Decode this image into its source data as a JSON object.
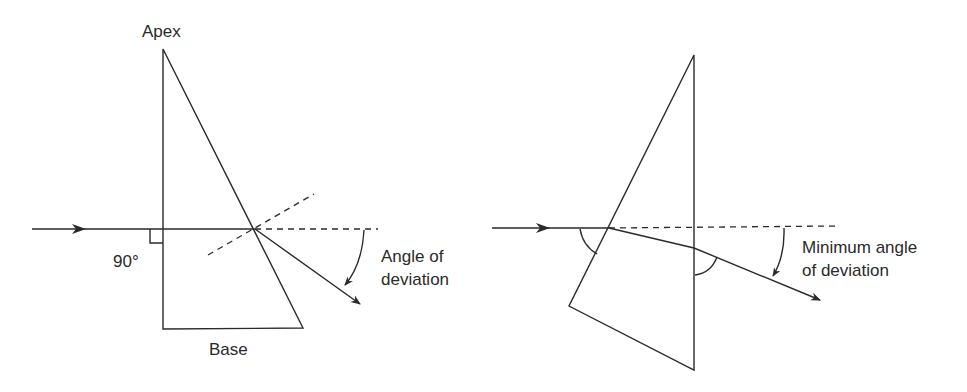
{
  "figures": [
    {
      "id": "prism-deviation",
      "labels": {
        "apex": "Apex",
        "right_angle": "90°",
        "base": "Base",
        "deviation_line1": "Angle of",
        "deviation_line2": "deviation"
      }
    },
    {
      "id": "prism-minimum-deviation",
      "labels": {
        "deviation_line1": "Minimum angle",
        "deviation_line2": "of deviation"
      }
    }
  ],
  "colors": {
    "line": "#2a2a2a",
    "background": "#ffffff"
  }
}
